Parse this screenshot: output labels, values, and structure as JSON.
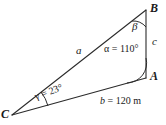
{
  "figure": {
    "type": "triangle-diagram",
    "stroke_color": "#2b2b2b",
    "background_color": "#ffffff",
    "vertices": [
      {
        "name": "A",
        "label": "A",
        "x": 146,
        "y": 78
      },
      {
        "name": "B",
        "label": "B",
        "x": 146,
        "y": 10
      },
      {
        "name": "C",
        "label": "C",
        "x": 12,
        "y": 115
      }
    ],
    "sides": [
      {
        "name": "a",
        "label": "a",
        "from": "C",
        "to": "B"
      },
      {
        "name": "b",
        "label_var": "b",
        "label_eq": "= 120 m",
        "value": 120,
        "unit": "m",
        "from": "C",
        "to": "A"
      },
      {
        "name": "c",
        "label": "c",
        "from": "A",
        "to": "B"
      }
    ],
    "angles": [
      {
        "at": "A",
        "symbol": "α",
        "label": "α = 110°",
        "value": 110,
        "unit": "°"
      },
      {
        "at": "B",
        "symbol": "β",
        "label": "β",
        "value": null,
        "unit": "°"
      },
      {
        "at": "C",
        "symbol": "γ",
        "label": "γ = 23°",
        "value": 23,
        "unit": "°"
      }
    ]
  },
  "labels": {
    "vertex_A": "A",
    "vertex_B": "B",
    "vertex_C": "C",
    "side_a": "a",
    "side_c": "c",
    "side_b_var": "b",
    "side_b_value": "= 120 m",
    "angle_alpha": "α = 110°",
    "angle_beta": "β",
    "angle_gamma": "γ = 23°"
  }
}
